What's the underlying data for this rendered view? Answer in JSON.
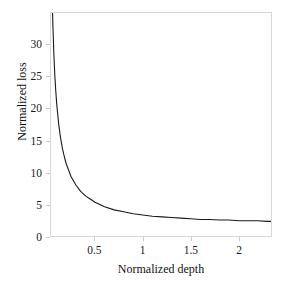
{
  "chart_data": {
    "type": "line",
    "title": "",
    "xlabel": "Normalized depth",
    "ylabel": "Normalized loss",
    "xlim": [
      0.04,
      2.34
    ],
    "ylim": [
      0,
      35
    ],
    "grid": false,
    "legend": null,
    "xticks": [
      "0.5",
      "1",
      "1.5",
      "2"
    ],
    "xtick_values": [
      0.5,
      1,
      1.5,
      2
    ],
    "yticks": [
      "0",
      "5",
      "10",
      "15",
      "20",
      "25",
      "30"
    ],
    "ytick_values": [
      0,
      5,
      10,
      15,
      20,
      25,
      30
    ],
    "series": [
      {
        "name": "normalized loss",
        "color": "#1a1a1a",
        "x": [
          0.055,
          0.06,
          0.07,
          0.08,
          0.09,
          0.1,
          0.12,
          0.14,
          0.16,
          0.18,
          0.2,
          0.25,
          0.3,
          0.35,
          0.4,
          0.45,
          0.5,
          0.6,
          0.7,
          0.8,
          0.9,
          1.0,
          1.1,
          1.2,
          1.3,
          1.4,
          1.5,
          1.6,
          1.7,
          1.8,
          1.9,
          2.0,
          2.1,
          2.2,
          2.3,
          2.34
        ],
        "y": [
          35.7,
          33.0,
          28.5,
          25.2,
          22.7,
          20.7,
          17.6,
          15.4,
          13.7,
          12.4,
          11.3,
          9.3,
          8.0,
          7.0,
          6.3,
          5.8,
          5.3,
          4.6,
          4.1,
          3.8,
          3.5,
          3.3,
          3.1,
          3.0,
          2.9,
          2.8,
          2.7,
          2.6,
          2.6,
          2.5,
          2.5,
          2.4,
          2.4,
          2.4,
          2.3,
          2.3
        ]
      }
    ]
  },
  "axes": {
    "ylabel_text": "Normalized loss",
    "xlabel_text": "Normalized depth"
  }
}
